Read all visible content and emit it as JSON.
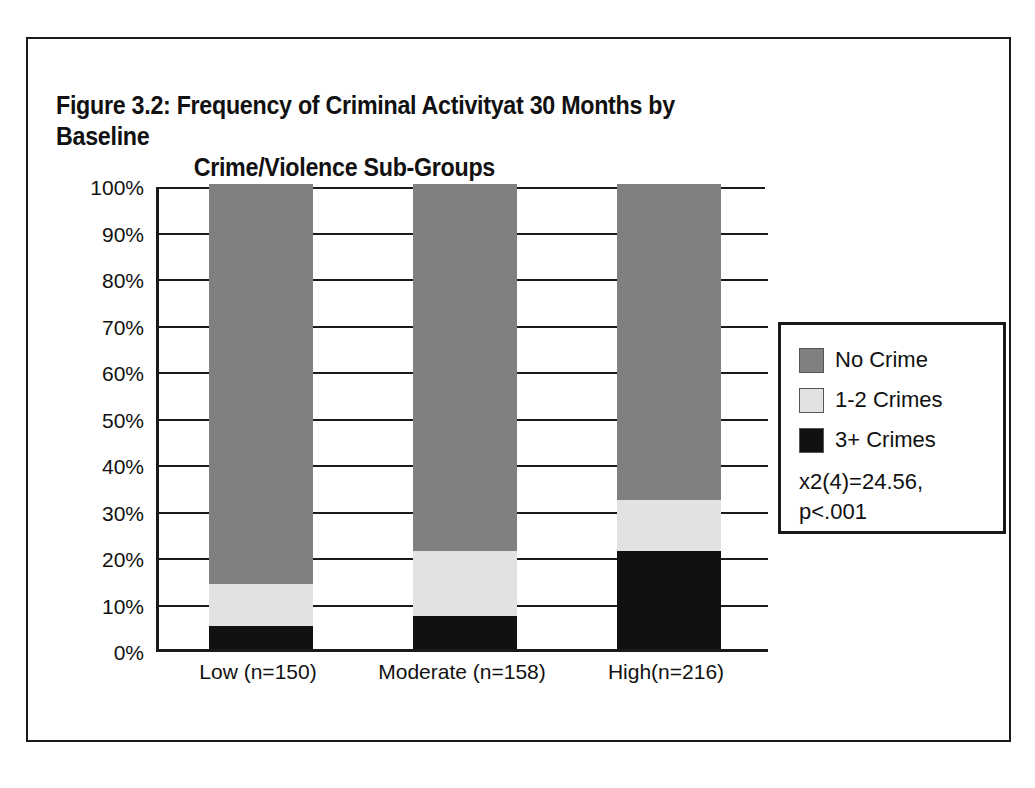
{
  "figure": {
    "title_line_1": "Figure 3.2: Frequency of Criminal Activityat 30  Months by Baseline",
    "title_line_2": "Crime/Violence Sub-Groups"
  },
  "legend": {
    "items": [
      {
        "label": "No Crime",
        "color": "#808080",
        "swatch_name": "legend-swatch-no-crime"
      },
      {
        "label": "1-2 Crimes",
        "color": "#e2e2e2",
        "swatch_name": "legend-swatch-1-2-crimes"
      },
      {
        "label": "3+ Crimes",
        "color": "#111111",
        "swatch_name": "legend-swatch-3plus-crimes"
      }
    ],
    "stats_line_1": "x2(4)=24.56,",
    "stats_line_2": "p<.001"
  },
  "chart_data": {
    "type": "bar",
    "subtype": "stacked-bar-100-percent",
    "title": "Figure 3.2: Frequency of Criminal Activityat 30  Months by Baseline Crime/Violence Sub-Groups",
    "xlabel": "",
    "ylabel": "",
    "ylim": [
      0,
      100
    ],
    "yticks": [
      "0%",
      "10%",
      "20%",
      "30%",
      "40%",
      "50%",
      "60%",
      "70%",
      "80%",
      "90%",
      "100%"
    ],
    "ytick_values": [
      0,
      10,
      20,
      30,
      40,
      50,
      60,
      70,
      80,
      90,
      100
    ],
    "grid": true,
    "legend_position": "right",
    "categories": [
      "Low (n=150)",
      "Moderate (n=158)",
      "High(n=216)"
    ],
    "series": [
      {
        "name": "3+ Crimes",
        "color": "#111111",
        "values": [
          5,
          7,
          21
        ]
      },
      {
        "name": "1-2 Crimes",
        "color": "#e2e2e2",
        "values": [
          9,
          14,
          11
        ]
      },
      {
        "name": "No Crime",
        "color": "#808080",
        "values": [
          86,
          79,
          68
        ]
      }
    ],
    "annotations": [
      "x2(4)=24.56,",
      "p<.001"
    ]
  }
}
